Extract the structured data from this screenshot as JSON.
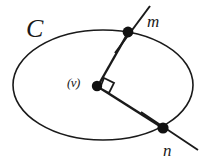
{
  "figure": {
    "background_color": "#ffffff",
    "stroke_color": "#1a1a1a",
    "labels": {
      "curve": "C",
      "center": "(v)",
      "point_upper": "m",
      "point_lower": "n"
    },
    "geometry": {
      "ellipse": {
        "cx": 103,
        "cy": 85,
        "rx": 90,
        "ry": 55
      },
      "center_point": {
        "x": 97,
        "y": 86
      },
      "point_m": {
        "x": 128,
        "y": 32
      },
      "point_n": {
        "x": 163,
        "y": 128
      },
      "radius_m": {
        "x1": 97,
        "y1": 86,
        "x2": 128,
        "y2": 32
      },
      "radius_n": {
        "x1": 97,
        "y1": 86,
        "x2": 163,
        "y2": 128
      },
      "tangent_m": {
        "x1": 117,
        "y1": 53,
        "x2": 149,
        "y2": 7
      },
      "tangent_n": {
        "x1": 142,
        "y1": 113,
        "x2": 197,
        "y2": 149
      },
      "right_angle_marker": {
        "size": 11
      }
    }
  }
}
